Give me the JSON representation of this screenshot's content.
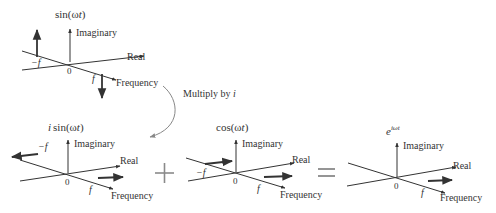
{
  "diagram": {
    "colors": {
      "ink": "#333333",
      "operator": "#8a8a8a",
      "curve": "#888888",
      "background": "#ffffff"
    },
    "panels": [
      {
        "id": "sin",
        "title_prefix": "",
        "title_func": "sin(",
        "title_omega": "ω",
        "title_t": "t",
        "title_close": ")",
        "axis_imaginary": "Imaginary",
        "axis_real": "Real",
        "axis_frequency": "Frequency",
        "origin": "0",
        "neg_freq": "−f",
        "pos_freq": "f"
      },
      {
        "id": "isin",
        "title_prefix": "i",
        "title_func": "sin(",
        "title_omega": "ω",
        "title_t": "t",
        "title_close": ")",
        "axis_imaginary": "Imaginary",
        "axis_real": "Real",
        "axis_frequency": "Frequency",
        "origin": "0",
        "neg_freq": "−f",
        "pos_freq": "f"
      },
      {
        "id": "cos",
        "title_func": "cos(",
        "title_omega": "ω",
        "title_t": "t",
        "title_close": ")",
        "axis_imaginary": "Imaginary",
        "axis_real": "Real",
        "axis_frequency": "Frequency",
        "origin": "0",
        "neg_freq": "−f",
        "pos_freq": "f"
      },
      {
        "id": "exp",
        "title_base": "e",
        "title_exponent": "iωt",
        "axis_imaginary": "Imaginary",
        "axis_real": "Real",
        "axis_frequency": "Frequency",
        "origin": "0",
        "pos_freq": "f"
      }
    ],
    "transform_label": "Multiply by ",
    "transform_var": "i",
    "plus": "+",
    "equals": "="
  }
}
